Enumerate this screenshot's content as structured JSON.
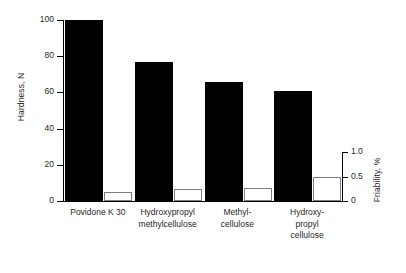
{
  "chart_data": {
    "type": "bar",
    "title": "",
    "subtitle": "",
    "xlabel": "",
    "ylabel": "Hardness, N",
    "y2label": "Friability, %",
    "grid": false,
    "legend_position": "none",
    "ylim": [
      0,
      100
    ],
    "y2lim": [
      0,
      1.0
    ],
    "yticks": [
      "0",
      "20",
      "40",
      "60",
      "80",
      "100"
    ],
    "ytick_values": [
      0,
      20,
      40,
      60,
      80,
      100
    ],
    "y2ticks": [
      "0",
      "0.5",
      "1.0"
    ],
    "y2tick_values": [
      0,
      0.5,
      1.0
    ],
    "categories": [
      "Povidone K 30",
      "Hydroxypropyl\nmethylcellulose",
      "Methyl-\ncellulose",
      "Hydroxy-\npropyl\ncellulose"
    ],
    "series": [
      {
        "name": "Hardness, N",
        "axis": "left",
        "color": "#000000",
        "values": [
          100,
          77,
          66,
          61
        ]
      },
      {
        "name": "Friability, %",
        "axis": "right",
        "color": "#ffffff",
        "edge_color": "#7c7c7c",
        "values": [
          0.18,
          0.24,
          0.27,
          0.48
        ]
      }
    ]
  },
  "axes": {
    "left_title": "Hardness, N",
    "right_title": "Friability, %"
  }
}
